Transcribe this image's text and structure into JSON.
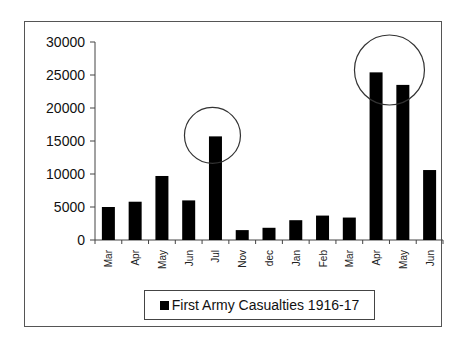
{
  "chart_data": {
    "type": "bar",
    "title": "",
    "xlabel": "",
    "ylabel": "",
    "ylim": [
      0,
      30000
    ],
    "yticks": [
      0,
      5000,
      10000,
      15000,
      20000,
      25000,
      30000
    ],
    "grid": false,
    "legend_position": "bottom",
    "categories": [
      "Mar",
      "Apr",
      "May",
      "Jun",
      "Jul",
      "Nov",
      "dec",
      "Jan",
      "Feb",
      "Mar",
      "Apr",
      "May",
      "Jun"
    ],
    "series": [
      {
        "name": "First Army Casualties 1916-17",
        "color": "#000000",
        "values": [
          5000,
          5800,
          9700,
          6000,
          15700,
          1500,
          1850,
          3000,
          3700,
          3400,
          25400,
          23500,
          10600
        ]
      }
    ],
    "annotations": [
      {
        "type": "circle",
        "around": "Jul"
      },
      {
        "type": "circle",
        "around": [
          "Apr",
          "May"
        ]
      }
    ]
  },
  "legend": {
    "label": "First Army Casualties 1916-17"
  }
}
